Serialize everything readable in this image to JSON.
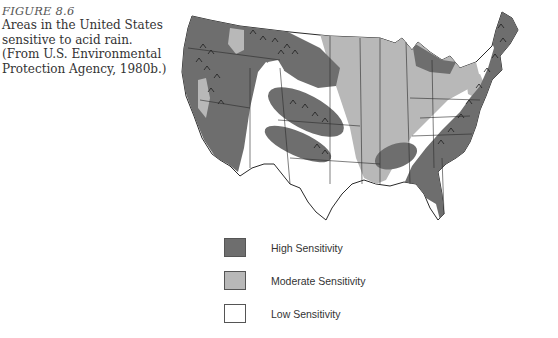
{
  "caption": {
    "figure_label": "FIGURE 8.6",
    "text": "Areas in the United States sensitive to acid rain. (From U.S. Environmental Protection Agency, 1980b.)"
  },
  "map": {
    "title": "Acid rain sensitivity of the contiguous United States",
    "mountain_symbol": "mountain-hatch"
  },
  "legend": {
    "items": [
      {
        "label": "High Sensitivity",
        "color": "#6e6e6e"
      },
      {
        "label": "Moderate Sensitivity",
        "color": "#b8b8b8"
      },
      {
        "label": "Low Sensitivity",
        "color": "#ffffff"
      }
    ]
  },
  "colors": {
    "high": "#6e6e6e",
    "moderate": "#b8b8b8",
    "low": "#ffffff",
    "border": "#2a2a2a"
  }
}
